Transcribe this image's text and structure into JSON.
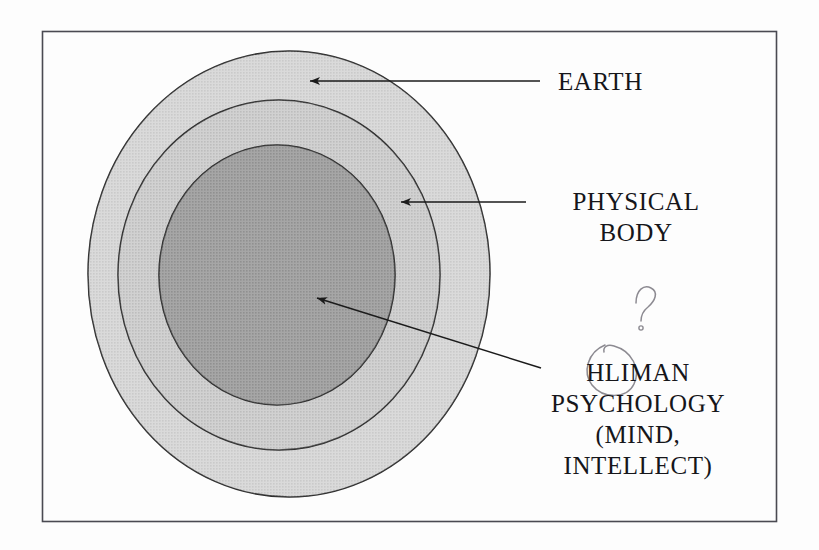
{
  "figure": {
    "type": "concentric-ellipse-diagram",
    "title_text": null,
    "border": {
      "color": "#4a4a52",
      "x": 42,
      "y": 31,
      "width": 735,
      "height": 491
    },
    "background_color": "#fdfdfd",
    "rings": [
      {
        "id": "outer",
        "name": "earth-ellipse",
        "label": "EARTH",
        "fill": "#d2d2d2",
        "stroke": "#2b2b2b",
        "cx": 289,
        "cy": 274,
        "rx": 201,
        "ry": 223
      },
      {
        "id": "middle",
        "name": "physical-body-ellipse",
        "label": "PHYSICAL BODY",
        "fill": "#c4c4c4",
        "stroke": "#2b2b2b",
        "cx": 279,
        "cy": 275,
        "rx": 161,
        "ry": 175
      },
      {
        "id": "inner",
        "name": "human-psychology-ellipse",
        "label": "HUMAN PSYCHOLOGY (MIND, INTELLECT)",
        "fill": "#8d8d8d",
        "stroke": "#2b2b2b",
        "cx": 277,
        "cy": 275,
        "rx": 118,
        "ry": 130
      }
    ],
    "arrows": [
      {
        "name": "earth-arrow",
        "target_ring": "outer",
        "x1": 540,
        "y1": 81,
        "x2": 307,
        "y2": 81,
        "color": "#1b1b1b"
      },
      {
        "name": "physical-body-arrow",
        "target_ring": "middle",
        "x1": 526,
        "y1": 202,
        "x2": 398,
        "y2": 202,
        "color": "#1b1b1b"
      },
      {
        "name": "human-psychology-arrow",
        "target_ring": "inner",
        "x1": 541,
        "y1": 368,
        "x2": 314,
        "y2": 297,
        "color": "#1b1b1b"
      }
    ],
    "annotations": [
      {
        "name": "handwritten-question-mark",
        "kind": "pen-mark",
        "glyph": "?",
        "description": "handwritten question mark above the word HLIMAN",
        "color": "#8c8a91"
      },
      {
        "name": "handwritten-circle",
        "kind": "pen-mark",
        "description": "handwritten loop circling the letters HLI",
        "color": "#8c8a91"
      }
    ]
  },
  "labels": {
    "earth": "EARTH",
    "physical_body_line1": "PHYSICAL",
    "physical_body_line2": "BODY",
    "core_line1": "HLIMAN",
    "core_line2": "PSYCHOLOGY",
    "core_line3": "(MIND,",
    "core_line4": "INTELLECT)"
  }
}
